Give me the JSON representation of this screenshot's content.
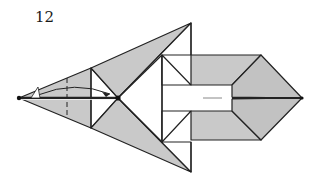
{
  "diagram": {
    "step_number": "12",
    "colors": {
      "paper_gray": "#c9c9c9",
      "paper_white": "#ffffff",
      "line": "#222222"
    }
  }
}
